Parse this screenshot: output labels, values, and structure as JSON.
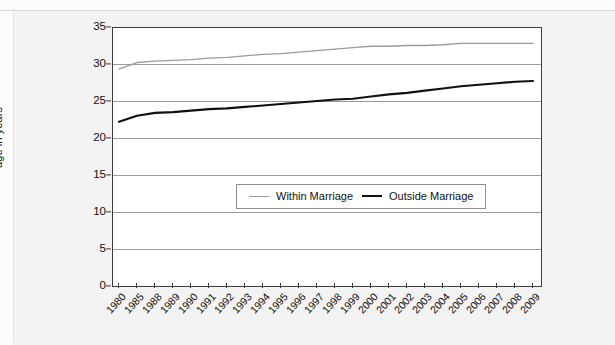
{
  "chart_data": {
    "type": "line",
    "title": "",
    "xlabel": "",
    "ylabel": "age in years",
    "ylim": [
      0,
      35
    ],
    "ytick_values": [
      0,
      5,
      10,
      15,
      20,
      25,
      30,
      35
    ],
    "grid": true,
    "legend_position": "center",
    "categories": [
      "1980",
      "1985",
      "1988",
      "1989",
      "1990",
      "1991",
      "1992",
      "1993",
      "1994",
      "1995",
      "1996",
      "1997",
      "1998",
      "1999",
      "2000",
      "2001",
      "2002",
      "2003",
      "2004",
      "2005",
      "2006",
      "2007",
      "2008",
      "2009"
    ],
    "series": [
      {
        "name": "Within Marriage",
        "color": "#9b9b9b",
        "values": [
          29.3,
          30.2,
          30.4,
          30.5,
          30.6,
          30.8,
          30.9,
          31.1,
          31.3,
          31.4,
          31.6,
          31.8,
          32.0,
          32.2,
          32.4,
          32.4,
          32.5,
          32.5,
          32.6,
          32.8,
          32.8,
          32.8,
          32.8,
          32.8
        ]
      },
      {
        "name": "Outside Marriage",
        "color": "#111111",
        "values": [
          22.2,
          23.0,
          23.4,
          23.5,
          23.7,
          23.9,
          24.0,
          24.2,
          24.4,
          24.6,
          24.8,
          25.0,
          25.2,
          25.3,
          25.6,
          25.9,
          26.1,
          26.4,
          26.7,
          27.0,
          27.2,
          27.4,
          27.6,
          27.7
        ]
      }
    ]
  },
  "legend": {
    "items": [
      {
        "label": "Within Marriage"
      },
      {
        "label": "Outside Marriage"
      }
    ]
  }
}
